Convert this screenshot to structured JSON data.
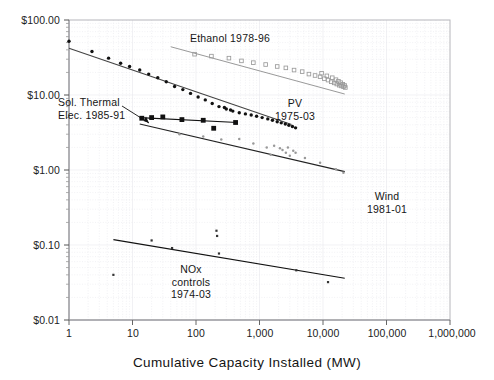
{
  "chart_data": {
    "type": "scatter",
    "title": "",
    "xlabel": "Cumulative Capacity Installed (MW)",
    "ylabel": "",
    "xscale": "log",
    "yscale": "log",
    "xlim": [
      1,
      1000000
    ],
    "ylim": [
      0.01,
      100
    ],
    "xticks": [
      1,
      10,
      100,
      1000,
      10000,
      100000,
      1000000
    ],
    "xticklabels": [
      "1",
      "10",
      "100",
      "1,000",
      "10,000",
      "100,000",
      "1,000,000"
    ],
    "yticks": [
      0.01,
      0.1,
      1,
      10,
      100
    ],
    "yticklabels": [
      "$0.01",
      "$0.10",
      "$1.00",
      "$10.00",
      "$100.00"
    ],
    "grid": "minor-log-dotted",
    "legend_position": "inline-annotations",
    "series": [
      {
        "name": "Ethanol 1978-96",
        "label": "Ethanol 1978-96",
        "label_x": 1200,
        "label_y": 52,
        "marker": "open-square",
        "color": "#9a9a9a",
        "trend_color": "#8d8d8d",
        "trend": [
          [
            40,
            44.0
          ],
          [
            22000,
            10.3
          ]
        ],
        "points": [
          [
            95,
            35.0
          ],
          [
            175,
            33.0
          ],
          [
            330,
            31.0
          ],
          [
            520,
            28.5
          ],
          [
            800,
            27.0
          ],
          [
            1250,
            25.5
          ],
          [
            1900,
            24.0
          ],
          [
            2600,
            23.0
          ],
          [
            3500,
            21.5
          ],
          [
            4700,
            20.5
          ],
          [
            6000,
            19.0
          ],
          [
            7500,
            18.2
          ],
          [
            9000,
            17.5
          ],
          [
            10500,
            16.5
          ],
          [
            12000,
            15.8
          ],
          [
            13500,
            15.0
          ],
          [
            15000,
            14.5
          ],
          [
            16500,
            14.0
          ],
          [
            18000,
            13.5
          ],
          [
            19500,
            13.2
          ],
          [
            21000,
            12.9
          ],
          [
            22500,
            12.6
          ],
          [
            9500,
            19.5
          ],
          [
            11500,
            18.0
          ],
          [
            14000,
            17.0
          ],
          [
            16000,
            16.0
          ],
          [
            17500,
            15.2
          ],
          [
            19000,
            14.6
          ],
          [
            20500,
            13.9
          ],
          [
            22000,
            13.4
          ]
        ]
      },
      {
        "name": "PV 1975-03",
        "label": "PV\n1975-03",
        "label_line1": "PV",
        "label_line2": "1975-03",
        "label_x": 3000,
        "label_y": 13.5,
        "marker": "filled-dot",
        "color": "#111111",
        "trend_color": "#444444",
        "trend": [
          [
            1.0,
            42.0
          ],
          [
            3200,
            4.05
          ]
        ],
        "points": [
          [
            1.0,
            52.0
          ],
          [
            2.3,
            38.0
          ],
          [
            4.2,
            31.0
          ],
          [
            6.5,
            26.5
          ],
          [
            9.0,
            24.0
          ],
          [
            13.0,
            21.5
          ],
          [
            18.0,
            19.0
          ],
          [
            25.0,
            17.0
          ],
          [
            34.0,
            15.0
          ],
          [
            46.0,
            13.0
          ],
          [
            62.0,
            11.8
          ],
          [
            82.0,
            10.5
          ],
          [
            108.0,
            9.4
          ],
          [
            140.0,
            8.6
          ],
          [
            180.0,
            7.7
          ],
          [
            230.0,
            7.0
          ],
          [
            300.0,
            6.5
          ],
          [
            380.0,
            6.1
          ],
          [
            480.0,
            5.8
          ],
          [
            600.0,
            5.6
          ],
          [
            740.0,
            5.4
          ],
          [
            900.0,
            5.2
          ],
          [
            1100.0,
            5.0
          ],
          [
            1350.0,
            4.8
          ],
          [
            1600.0,
            4.6
          ],
          [
            1900.0,
            4.4
          ],
          [
            2200.0,
            4.25
          ],
          [
            2550.0,
            4.1
          ],
          [
            2900.0,
            3.95
          ],
          [
            3300.0,
            3.8
          ],
          [
            3700.0,
            3.65
          ],
          [
            280.0,
            6.8
          ],
          [
            350.0,
            6.3
          ]
        ]
      },
      {
        "name": "Sol. Thermal Elec. 1985-91",
        "label": "Sol. Thermal\nElec. 1985-91",
        "label_line1": "Sol. Thermal",
        "label_line2": "Elec. 1985-91",
        "label_x": 5.0,
        "label_y": 11.0,
        "marker": "filled-square",
        "color": "#111111",
        "trend_color": "#111111",
        "trend": [
          [
            13,
            5.0
          ],
          [
            450,
            4.3
          ]
        ],
        "points": [
          [
            14,
            4.9
          ],
          [
            20,
            5.0
          ],
          [
            30,
            5.1
          ],
          [
            60,
            4.7
          ],
          [
            130,
            4.6
          ],
          [
            190,
            3.6
          ],
          [
            420,
            4.3
          ]
        ]
      },
      {
        "name": "Wind 1981-01",
        "label": "Wind\n1981-01",
        "label_line1": "Wind",
        "label_line2": "1981-01",
        "label_x": 12000,
        "label_y": 0.52,
        "marker": "small-gray-dot",
        "color": "#999999",
        "trend_color": "#222222",
        "trend": [
          [
            13,
            4.1
          ],
          [
            22000,
            0.95
          ]
        ],
        "points": [
          [
            55,
            3.0
          ],
          [
            130,
            2.8
          ],
          [
            250,
            2.55
          ],
          [
            480,
            2.6
          ],
          [
            800,
            2.25
          ],
          [
            1300,
            2.0
          ],
          [
            1700,
            2.1
          ],
          [
            2100,
            1.95
          ],
          [
            2300,
            1.85
          ],
          [
            2600,
            1.7
          ],
          [
            3000,
            1.55
          ],
          [
            3700,
            1.7
          ],
          [
            1500,
            1.6
          ],
          [
            5200,
            1.45
          ],
          [
            9000,
            1.25
          ],
          [
            16000,
            1.02
          ],
          [
            21000,
            0.92
          ],
          [
            2800,
            2.0
          ],
          [
            3400,
            1.8
          ]
        ]
      },
      {
        "name": "NOx controls 1974-03",
        "label": "NOx\ncontrols\n1974-03",
        "label_line1": "NOx",
        "label_line2": "controls",
        "label_line3": "1974-03",
        "label_x": 300,
        "label_y": 0.042,
        "marker": "tiny-dot",
        "color": "#333333",
        "trend_color": "#111111",
        "trend": [
          [
            5.0,
            0.118
          ],
          [
            22000,
            0.036
          ]
        ],
        "points": [
          [
            5.0,
            0.04
          ],
          [
            20.0,
            0.115
          ],
          [
            42.0,
            0.091
          ],
          [
            210.0,
            0.155
          ],
          [
            215.0,
            0.132
          ],
          [
            230.0,
            0.077
          ],
          [
            3800.0,
            0.046
          ],
          [
            12000.0,
            0.032
          ]
        ]
      }
    ]
  },
  "axis": {
    "x_title": "Cumulative Capacity Installed (MW)"
  }
}
